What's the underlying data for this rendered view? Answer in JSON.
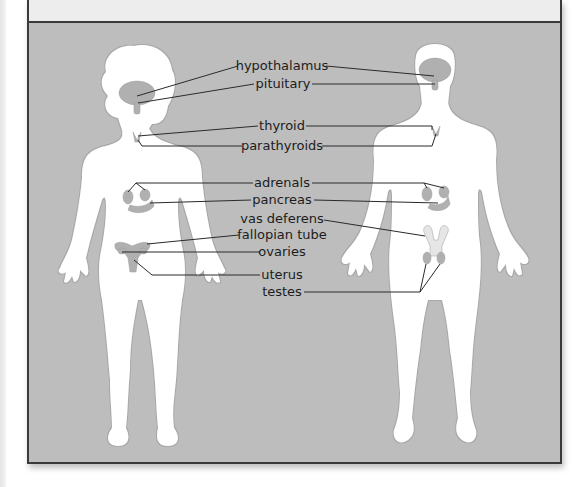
{
  "diagram": {
    "figures": [
      "female",
      "male"
    ],
    "labels": [
      {
        "id": "hypothalamus",
        "text": "hypothalamus",
        "targets": [
          "female",
          "male"
        ]
      },
      {
        "id": "pituitary",
        "text": "pituitary",
        "targets": [
          "female",
          "male"
        ]
      },
      {
        "id": "thyroid",
        "text": "thyroid",
        "targets": [
          "female",
          "male"
        ]
      },
      {
        "id": "parathyroids",
        "text": "parathyroids",
        "targets": [
          "female",
          "male"
        ]
      },
      {
        "id": "adrenals",
        "text": "adrenals",
        "targets": [
          "female",
          "male"
        ]
      },
      {
        "id": "pancreas",
        "text": "pancreas",
        "targets": [
          "female",
          "male"
        ]
      },
      {
        "id": "vas-deferens",
        "text": "vas deferens",
        "targets": [
          "male"
        ]
      },
      {
        "id": "fallopian-tube",
        "text": "fallopian tube",
        "targets": [
          "female"
        ]
      },
      {
        "id": "ovaries",
        "text": "ovaries",
        "targets": [
          "female"
        ]
      },
      {
        "id": "uterus",
        "text": "uterus",
        "targets": [
          "female"
        ]
      },
      {
        "id": "testes",
        "text": "testes",
        "targets": [
          "male"
        ]
      }
    ],
    "colors": {
      "panel_background": "#bdbdbd",
      "top_band": "#ededed",
      "body_fill": "#ffffff",
      "organ_fill": "#b0b0b0",
      "leader_line": "#2a2a2a",
      "border": "#3a3a3a"
    }
  }
}
